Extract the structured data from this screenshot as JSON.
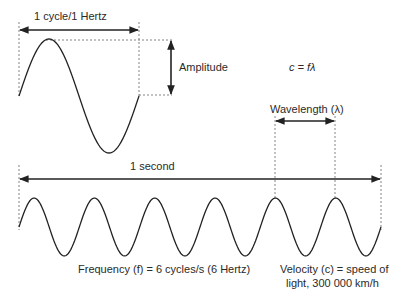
{
  "labels": {
    "cycle": "1 cycle/1 Hertz",
    "amplitude": "Amplitude",
    "formula": "c = fλ",
    "wavelength": "Wavelength (λ)",
    "second": "1 second",
    "frequency": "Frequency (f) = 6 cycles/s (6 Hertz)",
    "velocity_line1": "Velocity (c) = speed of",
    "velocity_line2": "light, 300 000 km/h"
  },
  "top_wave": {
    "cycles": 1,
    "x_start": 19,
    "x_end": 139,
    "mid_y": 96,
    "amplitude_px": 57
  },
  "bottom_wave": {
    "cycles": 6,
    "x_start": 19,
    "x_end": 381,
    "mid_y": 227,
    "amplitude_px": 29
  },
  "colors": {
    "line": "#222222",
    "dashed": "#555555"
  }
}
